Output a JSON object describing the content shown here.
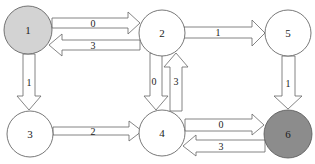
{
  "diagram": {
    "type": "directed-weighted-graph",
    "colors": {
      "background": "#ffffff",
      "node_default": "#ffffff",
      "node_source": "#d3d3d3",
      "node_target": "#8c8c8c",
      "stroke": "#666666"
    },
    "nodes": [
      {
        "id": "1",
        "label": "1",
        "fill": "#d3d3d3"
      },
      {
        "id": "2",
        "label": "2",
        "fill": "#ffffff"
      },
      {
        "id": "3",
        "label": "3",
        "fill": "#ffffff"
      },
      {
        "id": "4",
        "label": "4",
        "fill": "#ffffff"
      },
      {
        "id": "5",
        "label": "5",
        "fill": "#ffffff"
      },
      {
        "id": "6",
        "label": "6",
        "fill": "#8c8c8c"
      }
    ],
    "edges": [
      {
        "from": "1",
        "to": "2",
        "label": "0"
      },
      {
        "from": "2",
        "to": "1",
        "label": "3"
      },
      {
        "from": "2",
        "to": "5",
        "label": "1"
      },
      {
        "from": "1",
        "to": "3",
        "label": "1"
      },
      {
        "from": "2",
        "to": "4",
        "label": "0"
      },
      {
        "from": "4",
        "to": "2",
        "label": "3"
      },
      {
        "from": "5",
        "to": "6",
        "label": "1"
      },
      {
        "from": "3",
        "to": "4",
        "label": "2"
      },
      {
        "from": "4",
        "to": "6",
        "label": "0"
      },
      {
        "from": "6",
        "to": "4",
        "label": "3"
      }
    ]
  }
}
